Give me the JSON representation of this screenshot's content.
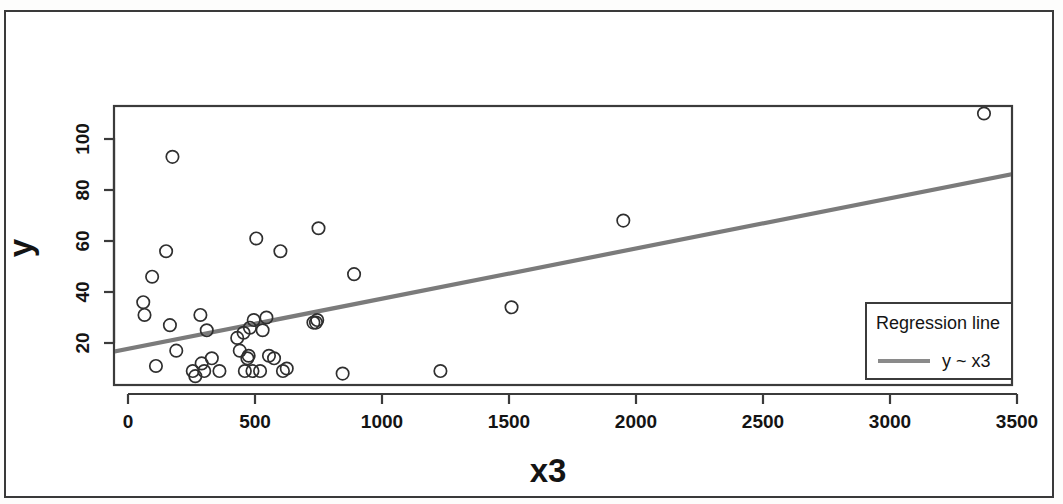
{
  "chart_data": {
    "type": "scatter",
    "title": "",
    "xlabel": "x3",
    "ylabel": "y",
    "xlim": [
      -60,
      3520
    ],
    "ylim": [
      2,
      117
    ],
    "grid": false,
    "x_ticks": [
      0,
      500,
      1000,
      1500,
      2000,
      2500,
      3000,
      3500
    ],
    "x_tick_labels": [
      "0",
      "500",
      "1000",
      "1500",
      "2000",
      "2500",
      "3000",
      "3500"
    ],
    "y_ticks": [
      20,
      40,
      60,
      80,
      100
    ],
    "y_tick_labels": [
      "20",
      "40",
      "60",
      "80",
      "100"
    ],
    "legend": {
      "position": "bottom-right",
      "title": "Regression line",
      "entries": [
        {
          "label": "y ~ x3",
          "marker": "line",
          "color": "#8a8a8a"
        }
      ]
    },
    "series": [
      {
        "name": "observations",
        "marker": "open-circle",
        "color": "#2f2f2f",
        "points": [
          [
            60,
            36
          ],
          [
            65,
            31
          ],
          [
            95,
            46
          ],
          [
            110,
            11
          ],
          [
            150,
            56
          ],
          [
            165,
            27
          ],
          [
            175,
            93
          ],
          [
            190,
            17
          ],
          [
            255,
            9
          ],
          [
            265,
            7
          ],
          [
            285,
            31
          ],
          [
            290,
            12
          ],
          [
            300,
            9
          ],
          [
            310,
            25
          ],
          [
            330,
            14
          ],
          [
            360,
            9
          ],
          [
            430,
            22
          ],
          [
            440,
            17
          ],
          [
            455,
            24
          ],
          [
            460,
            9
          ],
          [
            470,
            14
          ],
          [
            475,
            15
          ],
          [
            480,
            26
          ],
          [
            490,
            9
          ],
          [
            495,
            29
          ],
          [
            505,
            61
          ],
          [
            520,
            9
          ],
          [
            530,
            25
          ],
          [
            545,
            30
          ],
          [
            555,
            15
          ],
          [
            575,
            14
          ],
          [
            600,
            56
          ],
          [
            610,
            9
          ],
          [
            625,
            10
          ],
          [
            730,
            28
          ],
          [
            740,
            28
          ],
          [
            745,
            29
          ],
          [
            750,
            65
          ],
          [
            845,
            8
          ],
          [
            890,
            47
          ],
          [
            1230,
            9
          ],
          [
            1510,
            34
          ],
          [
            1950,
            68
          ],
          [
            3370,
            110
          ]
        ]
      }
    ],
    "fit_line": {
      "name": "y ~ x3",
      "x_start": -60,
      "y_start": 16.5,
      "x_end": 3520,
      "y_end": 87.0,
      "color": "#7b7b7b"
    }
  }
}
